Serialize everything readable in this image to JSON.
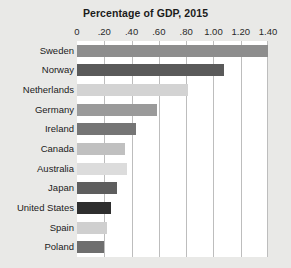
{
  "chart_data": {
    "type": "bar",
    "orientation": "horizontal",
    "title": "Percentage of GDP, 2015",
    "xlabel": "",
    "ylabel": "",
    "xlim": [
      0,
      1.4
    ],
    "grid": true,
    "legend": "none",
    "xticks": [
      0,
      0.2,
      0.4,
      0.6,
      0.8,
      1.0,
      1.2,
      1.4
    ],
    "xtick_labels": [
      "0",
      ".20",
      ".40",
      ".60",
      ".80",
      "1.00",
      "1.20",
      "1.40"
    ],
    "categories": [
      "Sweden",
      "Norway",
      "Netherlands",
      "Germany",
      "Ireland",
      "Canada",
      "Australia",
      "Japan",
      "United States",
      "Spain",
      "Poland"
    ],
    "values": [
      1.4,
      1.08,
      0.81,
      0.59,
      0.43,
      0.35,
      0.37,
      0.29,
      0.25,
      0.22,
      0.2
    ],
    "bar_colors": [
      "#8d8d8d",
      "#5a5a5a",
      "#d3d3d3",
      "#9a9a9a",
      "#757575",
      "#c0c0c0",
      "#dcdcdc",
      "#5e5e5e",
      "#2e2e2e",
      "#cfcfcf",
      "#6e6e6e"
    ]
  },
  "style": {
    "background": "#e9e9e7",
    "plot_background": "#ffffff",
    "gridline_color": "#bdbdbd",
    "text_color": "#1b1b1b"
  }
}
